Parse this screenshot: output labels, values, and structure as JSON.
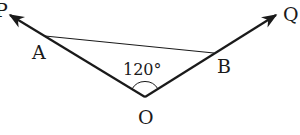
{
  "diagram": {
    "type": "geometry",
    "points": {
      "O": "O",
      "P": "P",
      "Q": "Q",
      "A": "A",
      "B": "B"
    },
    "angle_label": "120°",
    "angle_value_deg": 120,
    "rays": [
      "OP",
      "OQ"
    ],
    "segments": [
      "AB"
    ],
    "colors": {
      "stroke": "#1a1a1a",
      "background": "#ffffff"
    }
  }
}
